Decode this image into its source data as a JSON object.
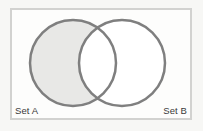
{
  "diagram": {
    "kind": "venn-diagram",
    "title": "",
    "shaded_region_description": "Set A only (A minus B)",
    "frame": {
      "border_color": "#d2d2d0",
      "background_color": "#fdfdfc",
      "x": 10,
      "y": 8,
      "width": 182,
      "height": 112
    },
    "canvas_background": "#f7f7f5",
    "stroke_color": "#7f7f7f",
    "stroke_width": 2.5,
    "fill_shaded": "#e8e8e6",
    "fill_unshaded": "#ffffff",
    "label_color": "#3a3a3a",
    "sets": [
      {
        "id": "A",
        "label": "Set A",
        "cx": 73,
        "cy": 63,
        "r": 43,
        "filled": true,
        "fill": "#e8e8e6"
      },
      {
        "id": "B",
        "label": "Set B",
        "cx": 122,
        "cy": 63,
        "r": 43,
        "filled": false,
        "fill": "#ffffff"
      }
    ]
  }
}
